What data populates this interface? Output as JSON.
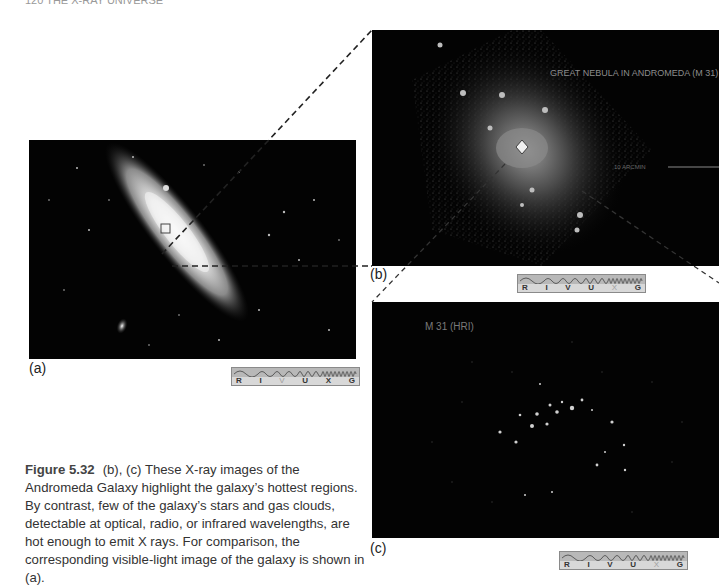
{
  "page": {
    "header_text": "120    THE X-RAY UNIVERSE"
  },
  "panels": [
    {
      "id": "a",
      "label": "(a)",
      "description": "Visible-light image of the Andromeda Galaxy",
      "spectrum_strip": {
        "letters": [
          "R",
          "I",
          "V",
          "U",
          "X",
          "G"
        ],
        "active": "V"
      }
    },
    {
      "id": "b",
      "label": "(b)",
      "description": "X-ray image of Andromeda Galaxy",
      "overlay_text": "GREAT NEBULA IN ANDROMEDA (M 31)",
      "scale_text": "10 ARCMIN",
      "spectrum_strip": {
        "letters": [
          "R",
          "I",
          "V",
          "U",
          "X",
          "G"
        ],
        "active": "X"
      }
    },
    {
      "id": "c",
      "label": "(c)",
      "description": "High-resolution X-ray image of Andromeda core",
      "overlay_text": "M 31 (HRI)",
      "spectrum_strip": {
        "letters": [
          "R",
          "I",
          "V",
          "U",
          "X",
          "G"
        ],
        "active": "X"
      }
    }
  ],
  "caption": {
    "figure_number": "Figure 5.32",
    "text": "(b), (c) These X-ray images of the Andromeda Galaxy highlight the galaxy’s hottest regions. By contrast, few of the galaxy’s stars and gas clouds, detectable at optical, radio, or infrared wavelengths, are hot enough to emit X rays. For comparison, the corresponding visible-light image of the galaxy is shown in (a)."
  }
}
